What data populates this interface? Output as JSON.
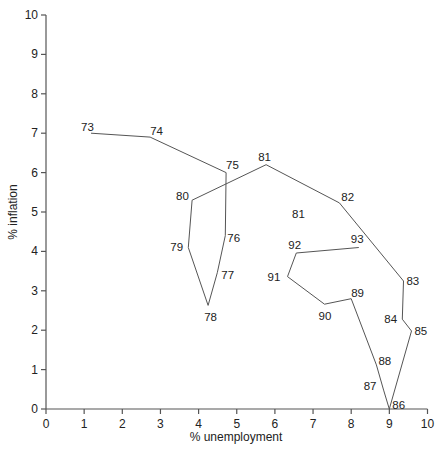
{
  "chart_data": {
    "type": "line",
    "title": "",
    "xlabel": "% unemployment",
    "ylabel": "% inflation",
    "xlim": [
      0,
      10
    ],
    "ylim": [
      0,
      10
    ],
    "grid": false,
    "legend": null,
    "x_ticks": [
      "0",
      "1",
      "2",
      "3",
      "4",
      "5",
      "6",
      "7",
      "8",
      "9",
      "10"
    ],
    "y_ticks": [
      "0",
      "1",
      "2",
      "3",
      "4",
      "5",
      "6",
      "7",
      "8",
      "9",
      "10"
    ],
    "series": [
      {
        "name": "Inflation vs unemployment by year",
        "points": [
          {
            "label": "73",
            "x": 1.18,
            "y": 7.0
          },
          {
            "label": "74",
            "x": 2.73,
            "y": 6.9
          },
          {
            "label": "75",
            "x": 4.72,
            "y": 6.0
          },
          {
            "label": "76",
            "x": 4.7,
            "y": 4.4
          },
          {
            "label": "77",
            "x": 4.49,
            "y": 3.46
          },
          {
            "label": "78",
            "x": 4.25,
            "y": 2.63
          },
          {
            "label": "79",
            "x": 3.73,
            "y": 4.1
          },
          {
            "label": "80",
            "x": 3.83,
            "y": 5.3
          },
          {
            "label": "81",
            "x": 5.77,
            "y": 6.2
          },
          {
            "label": "82",
            "x": 7.69,
            "y": 5.23
          },
          {
            "label": "83",
            "x": 9.37,
            "y": 3.25
          },
          {
            "label": "84",
            "x": 9.34,
            "y": 2.28
          },
          {
            "label": "85",
            "x": 9.58,
            "y": 1.98
          },
          {
            "label": "86",
            "x": 9.0,
            "y": 0.0
          },
          {
            "label": "87",
            "x": 8.85,
            "y": 0.48
          },
          {
            "label": "88",
            "x": 8.66,
            "y": 1.12
          },
          {
            "label": "89",
            "x": 8.0,
            "y": 2.8
          },
          {
            "label": "90",
            "x": 7.3,
            "y": 2.66
          },
          {
            "label": "91",
            "x": 6.33,
            "y": 3.36
          },
          {
            "label": "92",
            "x": 6.56,
            "y": 3.96
          },
          {
            "label": "93",
            "x": 8.2,
            "y": 4.1
          }
        ]
      }
    ],
    "annotations": [
      {
        "text": "81",
        "x": 6.45,
        "y": 4.85
      }
    ]
  },
  "layout": {
    "plot": {
      "x0": 46,
      "y0": 409,
      "px_per_x": 38.15,
      "px_per_y": 39.4
    },
    "label_offsets": {
      "73": [
        -10,
        -2
      ],
      "74": [
        0,
        -2
      ],
      "75": [
        0,
        -4
      ],
      "76": [
        2,
        6
      ],
      "77": [
        4,
        6
      ],
      "78": [
        -4,
        16
      ],
      "79": [
        -18,
        4
      ],
      "80": [
        -16,
        0
      ],
      "81": [
        -8,
        -4
      ],
      "82": [
        2,
        -2
      ],
      "83": [
        3,
        4
      ],
      "84": [
        -18,
        4
      ],
      "85": [
        3,
        4
      ],
      "86": [
        3,
        0
      ],
      "87": [
        -20,
        0
      ],
      "88": [
        2,
        0
      ],
      "89": [
        0,
        -2
      ],
      "90": [
        -6,
        16
      ],
      "91": [
        -20,
        4
      ],
      "92": [
        -8,
        -4
      ],
      "93": [
        -8,
        -4
      ]
    },
    "line_color": "#555555",
    "text_color": "#222222"
  }
}
